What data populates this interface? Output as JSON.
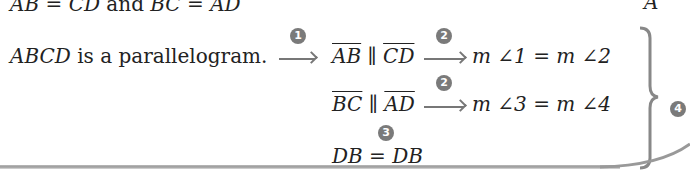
{
  "top_line": {
    "lhs1": "AB",
    "eq1": " = ",
    "rhs1": "CD",
    "conj": " and ",
    "lhs2": "BC",
    "eq2": " = ",
    "rhs2": "AD",
    "corner_label": "A"
  },
  "flow": {
    "start": {
      "italic": "ABCD",
      "rest": " is a parallelogram."
    },
    "row1": {
      "seg1": "AB",
      "parallel": " ∥ ",
      "seg2": "CD",
      "result": "m ∠1 = m ∠2"
    },
    "row2": {
      "seg1": "BC",
      "parallel": " ∥ ",
      "seg2": "AD",
      "result": "m ∠3 = m ∠4"
    },
    "row3": {
      "statement": "DB = DB"
    }
  },
  "badges": {
    "b1": "1",
    "b2a": "2",
    "b2b": "2",
    "b3": "3",
    "b4": "4"
  },
  "colors": {
    "badge": "#7a7a7a",
    "arrow": "#777777",
    "text": "#222222"
  }
}
